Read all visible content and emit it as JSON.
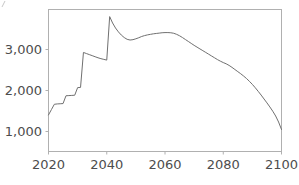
{
  "chart_data": {
    "type": "line",
    "title": "",
    "subtitle": "",
    "xlabel": "",
    "ylabel": "",
    "xlim": [
      2020,
      2100
    ],
    "ylim": [
      0,
      4000
    ],
    "grid": false,
    "legend": null,
    "xticks": [
      2020,
      2040,
      2060,
      2080,
      2100
    ],
    "xtick_labels": [
      "2020",
      "2040",
      "2060",
      "2080",
      "2100"
    ],
    "yticks": [
      1000,
      2000,
      3000
    ],
    "ytick_labels": [
      "1,000",
      "2,000",
      "3,000"
    ],
    "line_color": "#707070",
    "axis_color": "#b0b0b0",
    "series": [
      {
        "name": "series-1",
        "x": [
          2020,
          2021,
          2022,
          2023,
          2024,
          2025,
          2026,
          2027,
          2028,
          2029,
          2030,
          2031,
          2032,
          2033,
          2034,
          2035,
          2036,
          2037,
          2038,
          2039,
          2040,
          2041,
          2042,
          2043,
          2044,
          2045,
          2046,
          2047,
          2048,
          2049,
          2050,
          2051,
          2052,
          2053,
          2054,
          2055,
          2056,
          2057,
          2058,
          2059,
          2060,
          2061,
          2062,
          2063,
          2064,
          2065,
          2066,
          2067,
          2068,
          2069,
          2070,
          2071,
          2072,
          2073,
          2074,
          2075,
          2076,
          2077,
          2078,
          2079,
          2080,
          2081,
          2082,
          2083,
          2084,
          2085,
          2086,
          2087,
          2088,
          2089,
          2090,
          2091,
          2092,
          2093,
          2094,
          2095,
          2096,
          2097,
          2098,
          2099,
          2100
        ],
        "y": [
          1030,
          1180,
          1330,
          1340,
          1345,
          1350,
          1570,
          1575,
          1580,
          1585,
          1800,
          1805,
          2790,
          2760,
          2730,
          2700,
          2670,
          2640,
          2615,
          2595,
          2575,
          3800,
          3620,
          3480,
          3370,
          3280,
          3210,
          3160,
          3140,
          3150,
          3175,
          3205,
          3240,
          3265,
          3285,
          3300,
          3315,
          3325,
          3335,
          3345,
          3350,
          3350,
          3345,
          3330,
          3300,
          3260,
          3210,
          3155,
          3100,
          3045,
          2990,
          2940,
          2890,
          2840,
          2790,
          2740,
          2690,
          2640,
          2590,
          2545,
          2505,
          2470,
          2425,
          2370,
          2310,
          2250,
          2190,
          2125,
          2055,
          1975,
          1890,
          1795,
          1695,
          1590,
          1480,
          1370,
          1255,
          1135,
          1000,
          830,
          620
        ]
      }
    ]
  },
  "axes": {
    "ytick_1": "1,000",
    "ytick_2": "2,000",
    "ytick_3": "3,000",
    "xtick_1": "2020",
    "xtick_2": "2040",
    "xtick_3": "2060",
    "xtick_4": "2080",
    "xtick_5": "2100"
  }
}
